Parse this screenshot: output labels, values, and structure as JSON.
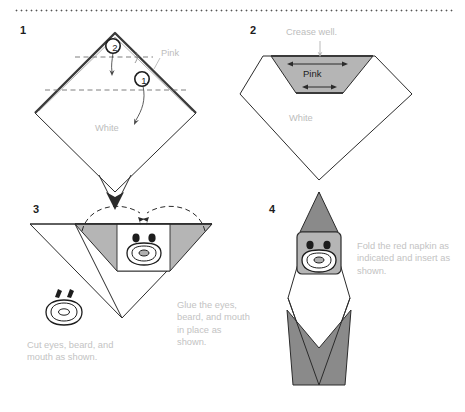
{
  "page": {
    "background_color": "#ffffff",
    "divider": "dotted-rule"
  },
  "palette": {
    "ink": "#2b2b2b",
    "caption_text": "#c3c3c3",
    "label_text": "#bdbdbd",
    "pink_fill_light": "#b5b5b5",
    "gray_fill_mid": "#8a8a8a",
    "white_fill": "#ffffff",
    "step_number": "#1d1d1d"
  },
  "steps": [
    {
      "number": "1",
      "labels": [
        {
          "name": "pink-label",
          "text": "Pink"
        },
        {
          "name": "white-label",
          "text": "White"
        }
      ],
      "markers": [
        {
          "name": "fold-marker-2",
          "text": "2"
        },
        {
          "name": "fold-marker-1",
          "text": "1"
        }
      ],
      "caption": ""
    },
    {
      "number": "2",
      "labels": [
        {
          "name": "pink-label",
          "text": "Pink"
        },
        {
          "name": "white-label",
          "text": "White"
        }
      ],
      "annotation": "Crease well.",
      "caption": ""
    },
    {
      "number": "3",
      "caption_left": "Cut eyes, beard, and mouth as shown.",
      "caption_right": "Glue the eyes, beard, and mouth in place as shown."
    },
    {
      "number": "4",
      "caption": "Fold the red napkin as indicated and insert as shown."
    }
  ]
}
